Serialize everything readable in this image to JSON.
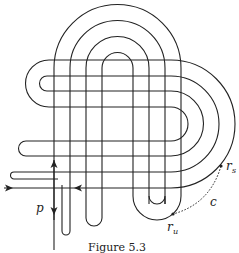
{
  "figure": {
    "caption": "Figure 5.3",
    "stroke_color": "#222222",
    "labels": {
      "p": "p",
      "r_s_main": "r",
      "r_s_sub": "s",
      "r_u_main": "r",
      "r_u_sub": "u",
      "c": "c"
    },
    "elements": [
      "nested top arches (4)",
      "nested right arcs (4)",
      "left hairpin loops",
      "bottom U-turn loops",
      "arrows on line p",
      "dashed curve c from r_u to r_s"
    ]
  }
}
